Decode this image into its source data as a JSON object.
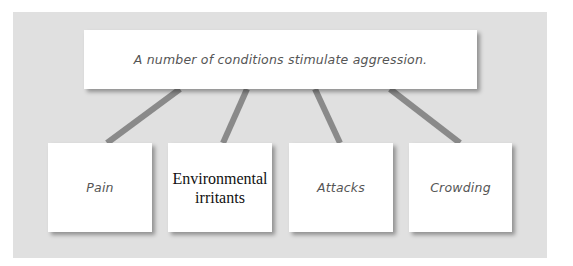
{
  "diagram": {
    "root": {
      "label": "A number of conditions stimulate aggression."
    },
    "children": [
      {
        "label": "Pain",
        "style": "handwritten"
      },
      {
        "label": "Environmental irritants",
        "style": "serif"
      },
      {
        "label": "Attacks",
        "style": "handwritten"
      },
      {
        "label": "Crowding",
        "style": "handwritten"
      }
    ],
    "colors": {
      "background": "#e0e0e0",
      "box": "#ffffff",
      "connector": "#8a8a8a",
      "handwritten_text": "#555555"
    }
  }
}
